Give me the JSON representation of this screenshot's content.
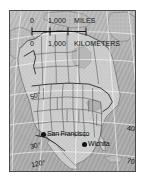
{
  "map": {
    "region": "North America",
    "projection_note": "",
    "background_color": "#ffffff",
    "ocean_color": "#b5b5b5",
    "land_color": "#cfcfcf",
    "border_color": "#4a4a4a",
    "graticule_color": "#ffffff",
    "boundary_color": "#1e1e1e",
    "scale": {
      "miles": {
        "zero": "0",
        "value": "1,000",
        "unit": "MILES"
      },
      "kilometers": {
        "zero": "0",
        "value": "1,000",
        "unit": "KILOMETERS"
      },
      "tick_count": 4
    },
    "graticule_labels": [
      {
        "id": "lat-50",
        "text": "50°"
      },
      {
        "id": "lat-30",
        "text": "30°"
      },
      {
        "id": "lat-40",
        "text": "40°"
      },
      {
        "id": "lon-70",
        "text": "70°"
      },
      {
        "id": "lon-120",
        "text": "120°"
      },
      {
        "id": "lon-90",
        "text": "90°"
      }
    ],
    "cities": [
      {
        "id": "san-francisco",
        "name": "San Francisco"
      },
      {
        "id": "wichita",
        "name": "Wichita"
      }
    ]
  }
}
